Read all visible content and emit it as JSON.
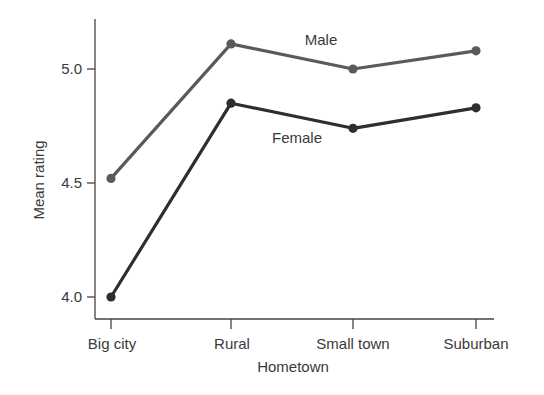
{
  "chart_data": {
    "type": "line",
    "title": "",
    "xlabel": "Hometown",
    "ylabel": "Mean rating",
    "categories": [
      "Big city",
      "Rural",
      "Small town",
      "Suburban"
    ],
    "series": [
      {
        "name": "Male",
        "values": [
          4.52,
          5.11,
          5.0,
          5.08
        ],
        "color": "#5a5a5a"
      },
      {
        "name": "Female",
        "values": [
          4.0,
          4.85,
          4.74,
          4.83
        ],
        "color": "#2e2e2e"
      }
    ],
    "yticks": [
      "4.0",
      "4.5",
      "5.0"
    ],
    "ytick_values": [
      4.0,
      4.5,
      5.0
    ],
    "ylim": [
      3.9,
      5.22
    ],
    "grid": false,
    "legend": "inline labels (Male above upper line, Female below lower line)"
  }
}
